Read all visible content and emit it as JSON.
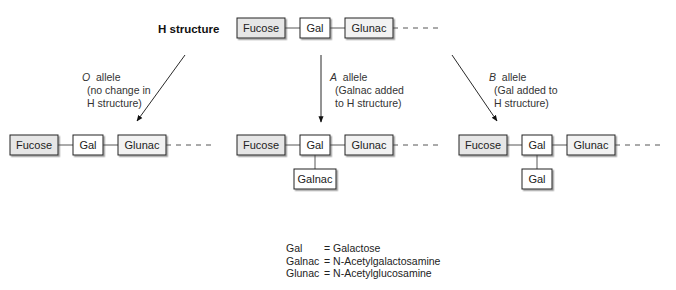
{
  "title": "H structure",
  "colors": {
    "shaded": "#e6e6e6",
    "plain": "#ffffff",
    "stroke": "#222222",
    "line": "#444444"
  },
  "h_structure": {
    "chain": [
      "Fucose",
      "Gal",
      "Glunac"
    ]
  },
  "alleles": [
    {
      "letter": "O",
      "word": "allele",
      "desc1": "(no change in",
      "desc2": "H structure)"
    },
    {
      "letter": "A",
      "word": "allele",
      "desc1": "(Galnac added",
      "desc2": "to H structure)"
    },
    {
      "letter": "B",
      "word": "allele",
      "desc1": "(Gal added to",
      "desc2": "H structure)"
    }
  ],
  "results": [
    {
      "chain": [
        "Fucose",
        "Gal",
        "Glunac"
      ],
      "branch": null
    },
    {
      "chain": [
        "Fucose",
        "Gal",
        "Glunac"
      ],
      "branch": "Galnac"
    },
    {
      "chain": [
        "Fucose",
        "Gal",
        "Glunac"
      ],
      "branch": "Gal"
    }
  ],
  "legend": [
    {
      "abbr": "Gal",
      "full": "= Galactose"
    },
    {
      "abbr": "Galnac",
      "full": "= N-Acetylgalactosamine"
    },
    {
      "abbr": "Glunac",
      "full": "= N-Acetylglucosamine"
    }
  ]
}
